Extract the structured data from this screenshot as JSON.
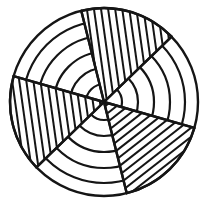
{
  "figure": {
    "style": "coloring-book line art",
    "background_color": "#ffffff",
    "stroke_color": "#151515",
    "fill_color": "#ffffff",
    "canvas": {
      "width": 211,
      "height": 208
    }
  },
  "chart_data": {
    "type": "pie",
    "xlabel": "",
    "ylabel": "",
    "grid": true,
    "legend": "none",
    "center": {
      "x": 104,
      "y": 102
    },
    "outer_radius": 94,
    "ring_count": 5,
    "ring_radii": [
      18,
      34,
      50,
      66,
      81,
      94
    ],
    "sector_count": 6,
    "categories": [
      "sector-top-hatched",
      "sector-upper-right-plain",
      "sector-lower-right-hatched",
      "sector-bottom-plain",
      "sector-lower-left-hatched",
      "sector-upper-left-plain"
    ],
    "values": [
      60,
      60,
      60,
      60,
      60,
      60
    ],
    "sector_boundaries_deg": [
      -104,
      -44,
      16,
      76,
      136,
      196
    ],
    "sectors": [
      {
        "name": "sector-top-hatched",
        "start_deg": -104,
        "end_deg": -44,
        "hatched": true,
        "hatch_angle_deg": 82
      },
      {
        "name": "sector-upper-right-plain",
        "start_deg": -44,
        "end_deg": 16,
        "hatched": false,
        "hatch_angle_deg": 0
      },
      {
        "name": "sector-lower-right-hatched",
        "start_deg": 16,
        "end_deg": 76,
        "hatched": true,
        "hatch_angle_deg": 322
      },
      {
        "name": "sector-bottom-plain",
        "start_deg": 76,
        "end_deg": 136,
        "hatched": false,
        "hatch_angle_deg": 0
      },
      {
        "name": "sector-lower-left-hatched",
        "start_deg": 136,
        "end_deg": 196,
        "hatched": true,
        "hatch_angle_deg": 82
      },
      {
        "name": "sector-upper-left-plain",
        "start_deg": 196,
        "end_deg": 256,
        "hatched": false,
        "hatch_angle_deg": 0
      }
    ],
    "hatch_spacing_px": 7,
    "stroke_width_outer": 2.4,
    "stroke_width_ring": 2.2,
    "stroke_width_spoke": 2.4,
    "stroke_width_hatch": 2.0
  }
}
